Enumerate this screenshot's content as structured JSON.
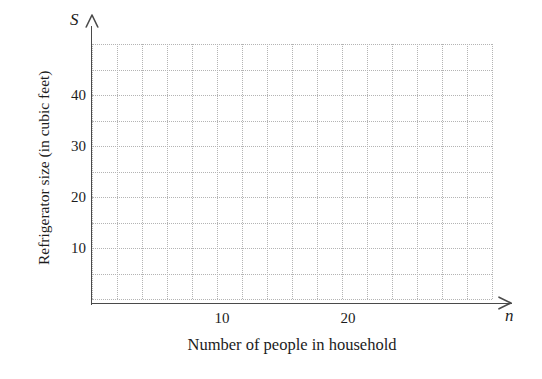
{
  "chart_data": {
    "type": "scatter",
    "title": "",
    "subtitle": "",
    "xlabel": "Number of people in household",
    "ylabel": "Refrigerator size (in cubic feet)",
    "x_axis_symbol": "n",
    "y_axis_symbol": "S",
    "xlim": [
      0,
      32
    ],
    "ylim": [
      0,
      50
    ],
    "x_tick_labels": [
      "10",
      "20"
    ],
    "x_tick_values": [
      10,
      20
    ],
    "y_tick_labels": [
      "10",
      "20",
      "30",
      "40"
    ],
    "y_tick_values": [
      10,
      20,
      30,
      40
    ],
    "x_gridline_step": 2,
    "y_gridline_step": 5,
    "grid": true,
    "grid_style": "dotted",
    "grid_color": "#b4b4b4",
    "axis_color": "#4a4a4a",
    "legend": null,
    "series": [],
    "values": [],
    "categories": [],
    "annotations": [],
    "note": "Empty coordinate grid with no plotted data points"
  },
  "axes": {
    "y_symbol": "S",
    "x_symbol": "n",
    "y_title": "Refrigerator size (in cubic feet)",
    "x_title": "Number of people in household",
    "y_ticks": [
      {
        "label": "40",
        "top": 88
      },
      {
        "label": "30",
        "top": 139
      },
      {
        "label": "20",
        "top": 190
      },
      {
        "label": "10",
        "top": 241
      }
    ],
    "x_ticks": [
      {
        "label": "10",
        "left": 222
      },
      {
        "label": "20",
        "left": 348
      }
    ]
  }
}
